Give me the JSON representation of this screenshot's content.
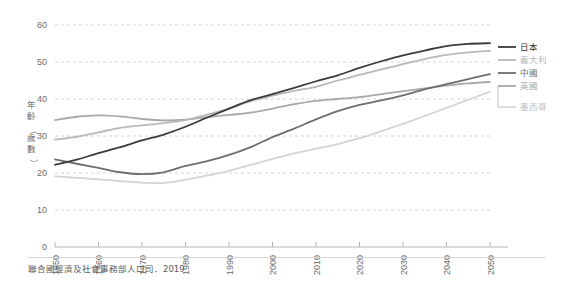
{
  "chart_data": {
    "type": "line",
    "title": "",
    "xlabel": "",
    "ylabel": "年齡（歲數）",
    "xlim": [
      1950,
      2050
    ],
    "ylim": [
      0,
      60
    ],
    "grid": true,
    "legend_position": "right",
    "xticks": [
      "1950",
      "1960",
      "1970",
      "1980",
      "1990",
      "2000",
      "2010",
      "2020",
      "2030",
      "2040",
      "2050"
    ],
    "yticks": [
      "0",
      "10",
      "20",
      "30",
      "40",
      "50",
      "60"
    ],
    "x": [
      1950,
      1955,
      1960,
      1965,
      1970,
      1975,
      1980,
      1985,
      1990,
      1995,
      2000,
      2005,
      2010,
      2015,
      2020,
      2025,
      2030,
      2035,
      2040,
      2045,
      2050
    ],
    "series": [
      {
        "name": "日本",
        "color": "#3c3c3c",
        "values": [
          22.2,
          23.6,
          25.4,
          27.0,
          28.8,
          30.4,
          32.5,
          35.0,
          37.4,
          39.7,
          41.3,
          43.0,
          44.8,
          46.4,
          48.4,
          50.2,
          51.8,
          53.1,
          54.3,
          54.9,
          55.1
        ]
      },
      {
        "name": "義大利",
        "color": "#b9b9b9",
        "values": [
          29.0,
          29.8,
          31.0,
          32.2,
          32.9,
          33.5,
          34.3,
          35.8,
          37.4,
          39.4,
          40.9,
          42.2,
          43.3,
          45.0,
          46.5,
          48.0,
          49.4,
          50.8,
          51.9,
          52.6,
          53.0
        ]
      },
      {
        "name": "中國",
        "color": "#6e6e6e",
        "values": [
          23.7,
          22.5,
          21.4,
          20.2,
          19.7,
          20.2,
          21.9,
          23.2,
          24.9,
          27.0,
          29.7,
          32.0,
          34.5,
          36.7,
          38.4,
          39.6,
          41.0,
          42.6,
          44.0,
          45.4,
          46.7
        ]
      },
      {
        "name": "英國",
        "color": "#a8a8a8",
        "values": [
          34.3,
          35.2,
          35.6,
          35.3,
          34.6,
          34.2,
          34.4,
          35.1,
          35.7,
          36.3,
          37.4,
          38.6,
          39.5,
          40.0,
          40.5,
          41.3,
          42.1,
          42.9,
          43.6,
          44.2,
          44.6
        ]
      },
      {
        "name": "墨西哥",
        "color": "#d4d4d4",
        "values": [
          19.1,
          18.7,
          18.3,
          17.8,
          17.4,
          17.3,
          18.2,
          19.3,
          20.6,
          22.2,
          23.8,
          25.3,
          26.6,
          27.8,
          29.4,
          31.3,
          33.3,
          35.4,
          37.6,
          39.8,
          42.0
        ]
      }
    ]
  },
  "legend": {
    "entries": [
      {
        "label": "日本",
        "color": "#3c3c3c"
      },
      {
        "label": "義大利",
        "color": "#b9b9b9"
      },
      {
        "label": "中國",
        "color": "#6e6e6e"
      },
      {
        "label": "英國",
        "color": "#a8a8a8"
      },
      {
        "label": "墨西哥",
        "color": "#d4d4d4"
      }
    ]
  },
  "source": {
    "note": "聯合國經濟及社會事務部人口司．2019"
  }
}
